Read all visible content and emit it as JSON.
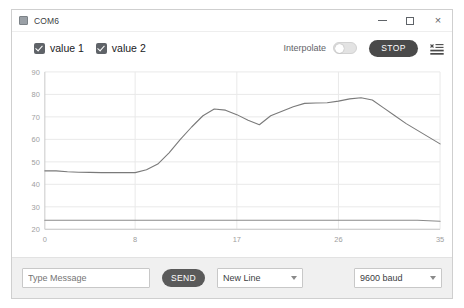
{
  "window": {
    "title": "COM6",
    "app_icon": "serial-monitor-icon",
    "controls": {
      "minimize": "–",
      "maximize": "□",
      "close": "×"
    }
  },
  "toolbar": {
    "series_toggles": [
      {
        "label": "value 1",
        "checked": true,
        "color": "#7d7d7d"
      },
      {
        "label": "value 2",
        "checked": true,
        "color": "#8a8a8a"
      }
    ],
    "interpolate_label": "Interpolate",
    "interpolate_on": false,
    "stop_label": "STOP",
    "clear_icon": "clear-list-icon"
  },
  "bottom_bar": {
    "message_placeholder": "Type Message",
    "message_value": "",
    "send_label": "SEND",
    "line_ending": {
      "selected": "New Line",
      "options": [
        "No Line Ending",
        "New Line",
        "Carriage Return",
        "Both NL & CR"
      ]
    },
    "baud_rate": {
      "selected": "9600 baud",
      "options": [
        "300 baud",
        "1200 baud",
        "9600 baud",
        "19200 baud",
        "115200 baud"
      ]
    }
  },
  "chart_data": {
    "type": "line",
    "title": "",
    "xlabel": "",
    "ylabel": "",
    "xlim": [
      0,
      35
    ],
    "ylim": [
      20,
      90
    ],
    "xticks": [
      0,
      8,
      17,
      26,
      35
    ],
    "yticks": [
      20,
      30,
      40,
      50,
      60,
      70,
      80,
      90
    ],
    "grid": true,
    "legend_position": "top-left",
    "line_color": "#7a7a7a",
    "grid_color": "#e9e9e9",
    "axis_color": "#c9c9c9",
    "tick_label_color": "#9e9e9e",
    "x": [
      0,
      1,
      2,
      3,
      4,
      5,
      6,
      7,
      8,
      9,
      10,
      11,
      12,
      13,
      14,
      15,
      16,
      17,
      18,
      19,
      20,
      21,
      22,
      23,
      24,
      25,
      26,
      27,
      28,
      29,
      30,
      31,
      32,
      33,
      34,
      35
    ],
    "series": [
      {
        "name": "value 1",
        "color": "#7a7a7a",
        "values": [
          46,
          46,
          45.6,
          45.4,
          45.3,
          45.2,
          45.2,
          45.2,
          45.2,
          46.5,
          49,
          54,
          60,
          65.5,
          70.5,
          73.5,
          73,
          71,
          68.5,
          66.5,
          70.5,
          72.5,
          74.5,
          76,
          76.2,
          76.3,
          77,
          78,
          78.5,
          77.5,
          74,
          70.5,
          67,
          64,
          61,
          58
        ]
      },
      {
        "name": "value 2",
        "color": "#8a8a8a",
        "values": [
          24,
          24,
          24,
          24,
          24,
          24,
          24,
          24,
          24,
          24,
          24,
          24,
          24,
          24,
          24,
          24,
          24,
          24,
          24,
          24,
          24,
          24,
          24,
          24,
          24,
          24,
          24,
          24,
          24,
          24,
          24,
          24,
          24,
          24,
          23.8,
          23.6
        ]
      }
    ]
  }
}
